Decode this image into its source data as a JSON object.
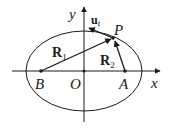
{
  "diagram": {
    "type": "ellipse-with-focal-vectors",
    "colors": {
      "stroke": "#1a1a1a",
      "background": "#ffffff"
    },
    "axes": {
      "x_label": "x",
      "y_label": "y"
    },
    "points": {
      "origin": "O",
      "focus_left": "B",
      "focus_right": "A",
      "point_on_ellipse": "P"
    },
    "vectors": {
      "r1": {
        "base": "R",
        "sub": "1",
        "from": "B",
        "to": "P"
      },
      "r2": {
        "base": "R",
        "sub": "2",
        "from": "A",
        "to": "P"
      },
      "ut": {
        "base": "u",
        "sub": "t",
        "from": "P",
        "description": "tangent unit vector"
      }
    }
  }
}
